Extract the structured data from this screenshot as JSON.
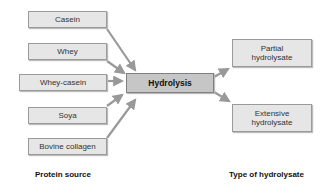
{
  "diagram": {
    "sources": [
      {
        "label": "Casein"
      },
      {
        "label": "Whey"
      },
      {
        "label": "Whey-casein"
      },
      {
        "label": "Soya"
      },
      {
        "label": "Bovine collagen"
      }
    ],
    "process": {
      "label": "Hydrolysis"
    },
    "outputs": [
      {
        "label": "Partial hydrolysate"
      },
      {
        "label": "Extensive hydrolysate"
      }
    ],
    "source_caption": "Protein source",
    "output_caption": "Type of hydrolysate",
    "colors": {
      "box_fill": "#e6e6e6",
      "hub_fill": "#c6c6c6",
      "arrow": "#999999"
    }
  }
}
